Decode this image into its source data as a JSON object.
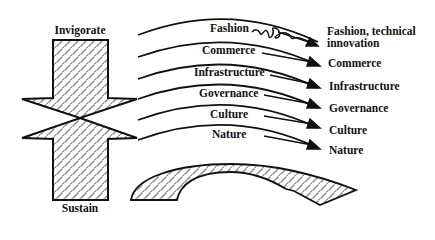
{
  "diagram": {
    "left_arrow": {
      "top_label": "Invigorate",
      "bottom_label": "Sustain"
    },
    "layers": [
      {
        "name": "Fashion",
        "outcome": "Fashion, technical",
        "outcome_line2": "innovation",
        "wavy": true
      },
      {
        "name": "Commerce",
        "outcome": "Commerce"
      },
      {
        "name": "Infrastructure",
        "outcome": "Infrastructure"
      },
      {
        "name": "Governance",
        "outcome": "Governance"
      },
      {
        "name": "Culture",
        "outcome": "Culture"
      },
      {
        "name": "Nature",
        "outcome": "Nature"
      }
    ],
    "colors": {
      "stroke": "#111111",
      "background": "#ffffff"
    }
  }
}
